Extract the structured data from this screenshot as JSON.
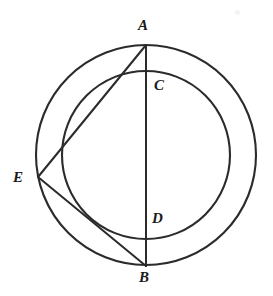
{
  "figure": {
    "background_color": "#ffffff",
    "stroke_color": "#2b2b2b",
    "canvas": {
      "width": 273,
      "height": 296
    }
  },
  "circles": [
    {
      "name": "outer-circle",
      "cx": 146,
      "cy": 155,
      "r": 110,
      "stroke_width": 2.1
    },
    {
      "name": "inner-circle",
      "cx": 146,
      "cy": 155,
      "r": 84,
      "stroke_width": 2.1
    }
  ],
  "points": [
    {
      "id": "A",
      "label": "A",
      "x": 146,
      "y": 45,
      "label_x": 138,
      "label_y": 18,
      "on": "outer-circle"
    },
    {
      "id": "C",
      "label": "C",
      "x": 146,
      "y": 71,
      "label_x": 154,
      "label_y": 78,
      "on": "inner-circle"
    },
    {
      "id": "E",
      "label": "E",
      "x": 38,
      "y": 177,
      "label_x": 13,
      "label_y": 170,
      "on": "outer-circle"
    },
    {
      "id": "D",
      "label": "D",
      "x": 146,
      "y": 239,
      "label_x": 152,
      "label_y": 211,
      "on": "inner-circle"
    },
    {
      "id": "B",
      "label": "B",
      "x": 146,
      "y": 266,
      "label_x": 139,
      "label_y": 270,
      "on": "outer-circle"
    }
  ],
  "segments": [
    {
      "name": "segment-AB",
      "from": "A",
      "to": "B",
      "x1": 146,
      "y1": 45,
      "x2": 146,
      "y2": 266,
      "stroke_width": 2.0
    },
    {
      "name": "segment-AE",
      "from": "A",
      "to": "E",
      "x1": 146,
      "y1": 45,
      "x2": 38,
      "y2": 177,
      "stroke_width": 2.0
    },
    {
      "name": "segment-EB",
      "from": "E",
      "to": "B",
      "x1": 38,
      "y1": 177,
      "x2": 146,
      "y2": 266,
      "stroke_width": 2.0
    }
  ],
  "artifacts": [
    {
      "name": "scan-smudge",
      "x": 235,
      "y": 10
    }
  ],
  "chart_data": {
    "type": "diagram",
    "subtype": "euclidean-geometry",
    "title": "",
    "labels": [
      "A",
      "C",
      "E",
      "D",
      "B"
    ],
    "shapes": [
      {
        "kind": "circle",
        "id": "outer",
        "center": [
          146,
          155
        ],
        "radius": 110
      },
      {
        "kind": "circle",
        "id": "inner",
        "center": [
          146,
          155
        ],
        "radius": 84
      },
      {
        "kind": "line",
        "id": "AB",
        "endpoints": [
          [
            146,
            45
          ],
          [
            146,
            266
          ]
        ]
      },
      {
        "kind": "line",
        "id": "AE",
        "endpoints": [
          [
            146,
            45
          ],
          [
            38,
            177
          ]
        ]
      },
      {
        "kind": "line",
        "id": "EB",
        "endpoints": [
          [
            38,
            177
          ],
          [
            146,
            266
          ]
        ]
      }
    ],
    "point_coordinates": {
      "A": [
        146,
        45
      ],
      "C": [
        146,
        71
      ],
      "E": [
        38,
        177
      ],
      "D": [
        146,
        239
      ],
      "B": [
        146,
        266
      ]
    }
  }
}
